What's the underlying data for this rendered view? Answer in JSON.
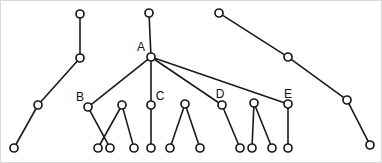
{
  "diagram": {
    "type": "node-link-graph",
    "title": "",
    "background_color": "#ffffff",
    "node_style": {
      "shape": "circle",
      "radius": 4,
      "fill": "#ffffff",
      "stroke": "#1a1a1a",
      "stroke_width": 1.7
    },
    "edge_style": {
      "stroke": "#1a1a1a",
      "stroke_width": 1.6
    },
    "label_style": {
      "color": "#111111",
      "font_size": 12
    },
    "nodes": [
      {
        "id": "n1",
        "label": "",
        "x": 80,
        "y": 14
      },
      {
        "id": "n2",
        "label": "",
        "x": 80,
        "y": 58
      },
      {
        "id": "n3",
        "label": "",
        "x": 38,
        "y": 105
      },
      {
        "id": "n4",
        "label": "",
        "x": 14,
        "y": 148
      },
      {
        "id": "n5",
        "label": "",
        "x": 149,
        "y": 13
      },
      {
        "id": "A",
        "label": "A",
        "x": 151,
        "y": 57
      },
      {
        "id": "B",
        "label": "B",
        "x": 88,
        "y": 107
      },
      {
        "id": "n6",
        "label": "",
        "x": 110,
        "y": 148
      },
      {
        "id": "n7",
        "label": "",
        "x": 122,
        "y": 105
      },
      {
        "id": "n8",
        "label": "",
        "x": 98,
        "y": 148
      },
      {
        "id": "n9",
        "label": "",
        "x": 134,
        "y": 148
      },
      {
        "id": "C",
        "label": "C",
        "x": 151,
        "y": 105
      },
      {
        "id": "n10",
        "label": "",
        "x": 151,
        "y": 148
      },
      {
        "id": "n11",
        "label": "",
        "x": 185,
        "y": 104
      },
      {
        "id": "n12",
        "label": "",
        "x": 170,
        "y": 148
      },
      {
        "id": "n13",
        "label": "",
        "x": 200,
        "y": 148
      },
      {
        "id": "D",
        "label": "D",
        "x": 222,
        "y": 105
      },
      {
        "id": "n14",
        "label": "",
        "x": 240,
        "y": 148
      },
      {
        "id": "n15",
        "label": "",
        "x": 254,
        "y": 103
      },
      {
        "id": "n16",
        "label": "",
        "x": 252,
        "y": 148
      },
      {
        "id": "n17",
        "label": "",
        "x": 272,
        "y": 148
      },
      {
        "id": "E",
        "label": "E",
        "x": 288,
        "y": 104
      },
      {
        "id": "n18",
        "label": "",
        "x": 288,
        "y": 148
      },
      {
        "id": "n19",
        "label": "",
        "x": 219,
        "y": 13
      },
      {
        "id": "n20",
        "label": "",
        "x": 288,
        "y": 57
      },
      {
        "id": "n21",
        "label": "",
        "x": 347,
        "y": 100
      },
      {
        "id": "n22",
        "label": "",
        "x": 370,
        "y": 145
      }
    ],
    "edges": [
      {
        "from": "n1",
        "to": "n2"
      },
      {
        "from": "n2",
        "to": "n3"
      },
      {
        "from": "n3",
        "to": "n4"
      },
      {
        "from": "n5",
        "to": "A"
      },
      {
        "from": "A",
        "to": "B"
      },
      {
        "from": "A",
        "to": "C"
      },
      {
        "from": "A",
        "to": "D"
      },
      {
        "from": "A",
        "to": "E"
      },
      {
        "from": "B",
        "to": "n6"
      },
      {
        "from": "n7",
        "to": "n8"
      },
      {
        "from": "n7",
        "to": "n9"
      },
      {
        "from": "C",
        "to": "n10"
      },
      {
        "from": "n11",
        "to": "n12"
      },
      {
        "from": "n11",
        "to": "n13"
      },
      {
        "from": "D",
        "to": "n14"
      },
      {
        "from": "n15",
        "to": "n16"
      },
      {
        "from": "n15",
        "to": "n17"
      },
      {
        "from": "E",
        "to": "n18"
      },
      {
        "from": "n19",
        "to": "n20"
      },
      {
        "from": "n20",
        "to": "n21"
      },
      {
        "from": "n21",
        "to": "n22"
      }
    ],
    "labels": [
      {
        "text": "A",
        "x": 141,
        "y": 51
      },
      {
        "text": "B",
        "x": 80,
        "y": 101
      },
      {
        "text": "C",
        "x": 160,
        "y": 100
      },
      {
        "text": "D",
        "x": 220,
        "y": 98
      },
      {
        "text": "E",
        "x": 288,
        "y": 98
      }
    ]
  }
}
